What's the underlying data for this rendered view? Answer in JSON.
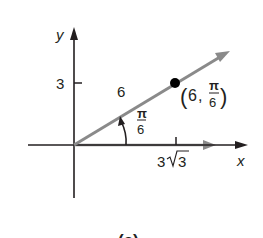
{
  "figure": {
    "caption": "(a)",
    "axes": {
      "x_label": "x",
      "y_label": "y",
      "x_tick_label": {
        "coef": "3",
        "radical": "3"
      },
      "y_tick_label": "3"
    },
    "ray": {
      "length_label": "6",
      "angle_label": {
        "numerator": "π",
        "denominator": "6"
      }
    },
    "point": {
      "open": "(",
      "r": "6",
      "sep": ",",
      "theta_numerator": "π",
      "theta_denominator": "6",
      "close": ")"
    },
    "colors": {
      "axis": "#231f20",
      "ray": "#8a8a8a",
      "point": "#000000",
      "text": "#231f20"
    }
  }
}
